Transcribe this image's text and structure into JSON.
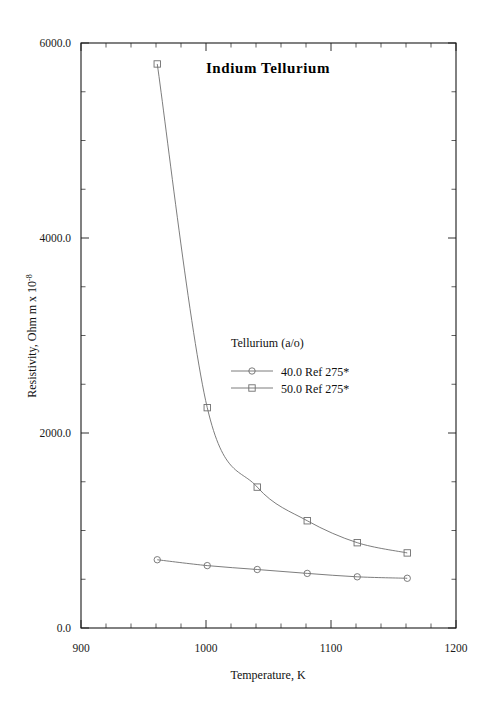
{
  "chart_data": {
    "type": "line",
    "title": "Indium  Tellurium",
    "xlabel": "Temperature,  K",
    "ylabel": "Resistivity, Ohm m x 10",
    "ylabel_exponent": "-8",
    "xlim": [
      900,
      1200
    ],
    "ylim": [
      0,
      6000
    ],
    "xticks": [
      900,
      1000,
      1100,
      1200
    ],
    "xticklabels": [
      "900",
      "1000",
      "1100",
      "1200"
    ],
    "yticks": [
      0,
      2000,
      4000,
      6000
    ],
    "yticklabels": [
      "0.0",
      "2000.0",
      "4000.0",
      "6000.0"
    ],
    "x_minor_interval": 20,
    "y_minor_interval": 500,
    "grid": false,
    "legend_position": "inside-right-middle",
    "legend_title": "Tellurium (a/o)",
    "series": [
      {
        "name": "40.0 Ref 275*",
        "marker": "circle",
        "x": [
          961,
          1001,
          1041,
          1081,
          1121,
          1161
        ],
        "y": [
          700,
          640,
          600,
          560,
          525,
          510
        ]
      },
      {
        "name": "50.0 Ref 275*",
        "marker": "square",
        "x": [
          961,
          1001,
          1041,
          1081,
          1121,
          1161
        ],
        "y": [
          5785,
          2260,
          1445,
          1100,
          875,
          770
        ]
      }
    ]
  },
  "colors": {
    "axis": "#1a1a1a",
    "series": "#6e6e6e",
    "background": "#ffffff"
  }
}
